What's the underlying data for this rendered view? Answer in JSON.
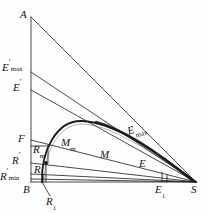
{
  "figure": {
    "type": "geometric-diagram",
    "stroke_color": "#1a1a1a",
    "background_color": "#ffffff"
  },
  "points": {
    "A": {
      "label": "A",
      "x": 31,
      "y": 17
    },
    "B": {
      "label": "B",
      "x": 31,
      "y": 182
    },
    "S": {
      "label": "S",
      "x": 196,
      "y": 182
    },
    "E_prime_max": {
      "label": "E'",
      "sub": "max",
      "x": 31,
      "y": 72
    },
    "E_prime": {
      "label": "E'",
      "sub": "",
      "x": 31,
      "y": 90
    },
    "F": {
      "label": "F",
      "x": 31,
      "y": 140
    },
    "R_prime": {
      "label": "R'",
      "x": 31,
      "y": 163
    },
    "R_prime_min": {
      "label": "R'",
      "sub": "min",
      "x": 31,
      "y": 180
    },
    "E_1": {
      "label": "E",
      "sub": "1",
      "x": 162,
      "y": 182
    },
    "R_1": {
      "label": "R",
      "sub": "1",
      "x": 46,
      "y": 182
    },
    "R_m": {
      "label": "R",
      "sub": "m",
      "x": 43,
      "y": 152
    },
    "R": {
      "label": "R",
      "x": 40,
      "y": 169
    },
    "M_m": {
      "label": "M",
      "sub": "m",
      "x": 70,
      "y": 145
    },
    "M": {
      "label": "M",
      "x": 108,
      "y": 158
    },
    "E": {
      "label": "E",
      "x": 145,
      "y": 167
    },
    "E_max": {
      "label": "E",
      "sub": "max",
      "x": 133,
      "y": 135
    }
  },
  "labels": [
    {
      "id": "label-A",
      "text": "A",
      "sub": "",
      "prime": false,
      "x": 21,
      "y": 10
    },
    {
      "id": "label-E-prime-max",
      "text": "E",
      "sub": "max",
      "prime": true,
      "x": 2,
      "y": 63
    },
    {
      "id": "label-E-prime",
      "text": "E",
      "sub": "",
      "prime": true,
      "x": 13,
      "y": 83
    },
    {
      "id": "label-F",
      "text": "F",
      "sub": "",
      "prime": false,
      "x": 18,
      "y": 134
    },
    {
      "id": "label-R-prime",
      "text": "R",
      "sub": "",
      "prime": true,
      "x": 12,
      "y": 156
    },
    {
      "id": "label-R-prime-min",
      "text": "R",
      "sub": "min",
      "prime": true,
      "x": 1,
      "y": 172
    },
    {
      "id": "label-B",
      "text": "B",
      "sub": "",
      "prime": false,
      "x": 24,
      "y": 185
    },
    {
      "id": "label-R1",
      "text": "R",
      "sub": "1",
      "prime": false,
      "x": 45,
      "y": 197
    },
    {
      "id": "label-Rm",
      "text": "R",
      "sub": "m",
      "prime": false,
      "x": 36,
      "y": 145
    },
    {
      "id": "label-R",
      "text": "R",
      "sub": "",
      "prime": false,
      "x": 36,
      "y": 165
    },
    {
      "id": "label-Mm",
      "text": "M",
      "sub": "m",
      "prime": false,
      "x": 62,
      "y": 138
    },
    {
      "id": "label-M",
      "text": "M",
      "sub": "",
      "prime": false,
      "x": 100,
      "y": 150
    },
    {
      "id": "label-E",
      "text": "E",
      "sub": "",
      "prime": false,
      "x": 139,
      "y": 159
    },
    {
      "id": "label-E-max",
      "text": "E",
      "sub": "max",
      "prime": false,
      "x": 127,
      "y": 127
    },
    {
      "id": "label-E1",
      "text": "E",
      "sub": "1",
      "prime": false,
      "x": 155,
      "y": 185
    },
    {
      "id": "label-S",
      "text": "S",
      "sub": "",
      "prime": false,
      "x": 192,
      "y": 185
    }
  ],
  "geometry": {
    "axis_x": 31,
    "baseline_y": 182,
    "apex_y": 17,
    "right_x": 196,
    "arc_path": "M 42 182 C 42 140, 58 120, 82 121 C 112 122, 150 148, 196 182",
    "chord_lines": [
      {
        "name": "line-A-S",
        "from": "A",
        "to": "S"
      },
      {
        "name": "line-Eprimemax-S",
        "from": "E_prime_max",
        "to": "S"
      },
      {
        "name": "line-Eprime-S",
        "from": "E_prime",
        "to": "S"
      },
      {
        "name": "line-F-S",
        "from": "F",
        "to": "S"
      },
      {
        "name": "line-Rprime-S",
        "from": "R_prime",
        "to": "S"
      },
      {
        "name": "line-Rprimemin-S",
        "from": "R_prime_min",
        "to": "S"
      },
      {
        "name": "line-B-S",
        "from": "B",
        "to": "S"
      }
    ]
  }
}
